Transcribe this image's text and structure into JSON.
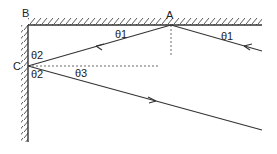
{
  "diagram": {
    "title": "",
    "points": {
      "A": "A",
      "B": "B",
      "C": "C"
    },
    "angles": {
      "theta1_incident": "θ1",
      "theta1_reflected": "θ1",
      "theta2_upper": "θ2",
      "theta2_lower": "θ2",
      "theta3": "θ3"
    },
    "elements": [
      "horizontal mirror (top) from B to right",
      "vertical mirror (left) from B downward",
      "incident ray toward A",
      "ray from A to C",
      "reflected ray from C",
      "normal at A (dashed)",
      "horizontal reference at C (dashed)"
    ]
  }
}
